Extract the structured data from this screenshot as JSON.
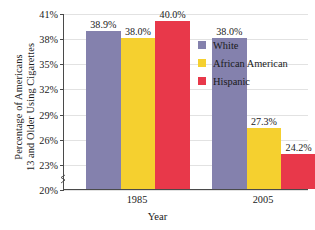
{
  "chart_data": {
    "type": "bar",
    "title": "",
    "subtitle": "",
    "xlabel": "Year",
    "ylabel_line1": "Percentage of Americans",
    "ylabel_line2": "13 and Older Using Cigarettes",
    "categories": [
      "1985",
      "2005"
    ],
    "series": [
      {
        "name": "White",
        "color": "#8481ad",
        "values": [
          38.9,
          38.0
        ],
        "labels": [
          "38.9%",
          "38.0%"
        ]
      },
      {
        "name": "African American",
        "color": "#f5d02f",
        "values": [
          38.0,
          27.3
        ],
        "labels": [
          "38.0%",
          "27.3%"
        ]
      },
      {
        "name": "Hispanic",
        "color": "#e8384a",
        "values": [
          40.0,
          24.2
        ],
        "labels": [
          "40.0%",
          "24.2%"
        ]
      }
    ],
    "ylim": [
      20,
      41
    ],
    "ytick_values": [
      41,
      38,
      35,
      32,
      29,
      26,
      23,
      20
    ],
    "ytick_labels": [
      "41%",
      "38%",
      "35%",
      "32%",
      "29%",
      "26%",
      "23%",
      "20%"
    ],
    "grid": true,
    "axis_break": true,
    "legend_position": "right-inside",
    "legend_entries": [
      "White",
      "African American",
      "Hispanic"
    ]
  }
}
